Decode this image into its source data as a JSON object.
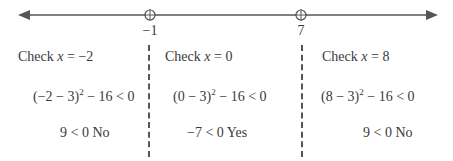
{
  "number_line": {
    "points": [
      {
        "label": "−1",
        "x": 150,
        "marker": "open-circle-with-crosshair"
      },
      {
        "label": "7",
        "x": 301,
        "marker": "open-circle-with-crosshair"
      }
    ],
    "arrows": "both-directions"
  },
  "regions": [
    {
      "check_prefix": "Check ",
      "var": "x",
      "check_suffix": " = −2",
      "expr_base": "(−2 − 3)",
      "exp": "2",
      "expr_rest": " − 16 < 0",
      "result": "9 < 0 No"
    },
    {
      "check_prefix": "Check ",
      "var": "x",
      "check_suffix": " = 0",
      "expr_base": "(0 − 3)",
      "exp": "2",
      "expr_rest": " − 16 < 0",
      "result": "−7 < 0 Yes"
    },
    {
      "check_prefix": "Check ",
      "var": "x",
      "check_suffix": " = 8",
      "expr_base": "(8 − 3)",
      "exp": "2",
      "expr_rest": " − 16 < 0",
      "result": "9 < 0 No"
    }
  ]
}
